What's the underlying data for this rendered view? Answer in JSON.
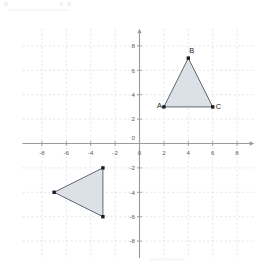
{
  "chart_data": {
    "type": "scatter",
    "title": "",
    "xlabel": "",
    "ylabel": "",
    "xlim": [
      -9.6,
      9.4
    ],
    "ylim": [
      -9.4,
      9.4
    ],
    "grid": true,
    "grid_step": 2,
    "legend": "none",
    "x_ticks": [
      -8,
      -6,
      -4,
      -2,
      0,
      2,
      4,
      6,
      8
    ],
    "y_ticks": [
      -8,
      -6,
      -4,
      -2,
      2,
      4,
      6,
      8
    ],
    "x_tick_labels": [
      "-8",
      "-6",
      "-4",
      "-2",
      "0",
      "2",
      "4",
      "6",
      "8"
    ],
    "y_tick_labels": [
      "-8",
      "-6",
      "-4",
      "-2",
      "2",
      "4",
      "6",
      "8"
    ],
    "origin_label": "0",
    "shapes": [
      {
        "name": "triangle-abc",
        "kind": "polygon",
        "vertices": [
          {
            "label": "A",
            "x": 2,
            "y": 3,
            "label_dx": -7,
            "label_dy": 1
          },
          {
            "label": "B",
            "x": 4,
            "y": 7,
            "label_dx": 1,
            "label_dy": -5
          },
          {
            "label": "C",
            "x": 6,
            "y": 3,
            "label_dx": 3,
            "label_dy": 2
          }
        ],
        "fill": "#d6dce3",
        "stroke": "#61666d",
        "show_labels": true
      },
      {
        "name": "triangle-image",
        "kind": "polygon",
        "vertices": [
          {
            "label": "",
            "x": -3,
            "y": -2,
            "label_dx": 0,
            "label_dy": 0
          },
          {
            "label": "",
            "x": -7,
            "y": -4,
            "label_dx": 0,
            "label_dy": 0
          },
          {
            "label": "",
            "x": -3,
            "y": -6,
            "label_dx": 0,
            "label_dy": 0
          }
        ],
        "fill": "#d6dce3",
        "stroke": "#61666d",
        "show_labels": false
      }
    ]
  },
  "colors": {
    "grid": "#d9dde2",
    "axis": "#9a9a9a",
    "shape_fill": "#d6dce3",
    "shape_stroke": "#61666d",
    "vertex": "#1b1b1b",
    "tick_text": "#5d6066",
    "background": "#ffffff"
  }
}
